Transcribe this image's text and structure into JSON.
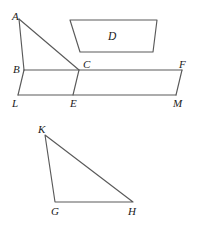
{
  "figure": {
    "background_color": "#ffffff",
    "stroke_color": "#5a5a5a",
    "label_color": "#1a1a1a",
    "width": 199,
    "height": 229,
    "points": {
      "A": {
        "x": 19,
        "y": 19
      },
      "B": {
        "x": 24,
        "y": 70
      },
      "C": {
        "x": 79,
        "y": 70
      },
      "F": {
        "x": 182,
        "y": 70
      },
      "L": {
        "x": 18,
        "y": 95
      },
      "E": {
        "x": 73,
        "y": 95
      },
      "M": {
        "x": 176,
        "y": 95
      },
      "D1": {
        "x": 70,
        "y": 20
      },
      "D2": {
        "x": 157,
        "y": 20
      },
      "D3": {
        "x": 153,
        "y": 52
      },
      "D4": {
        "x": 80,
        "y": 52
      },
      "K": {
        "x": 45,
        "y": 135
      },
      "G": {
        "x": 55,
        "y": 202
      },
      "H": {
        "x": 133,
        "y": 202
      }
    },
    "shapes": [
      {
        "name": "triangle-abc",
        "vertices": [
          "A",
          "B",
          "C"
        ]
      },
      {
        "name": "parallelogram-bcel",
        "vertices": [
          "B",
          "C",
          "E",
          "L"
        ]
      },
      {
        "name": "parallelogram-cfme",
        "vertices": [
          "C",
          "F",
          "M",
          "E"
        ]
      },
      {
        "name": "parallelogram-d",
        "vertices": [
          "D1",
          "D2",
          "D3",
          "D4"
        ]
      },
      {
        "name": "triangle-kgh",
        "vertices": [
          "K",
          "G",
          "H"
        ]
      }
    ],
    "labels": {
      "A": "A",
      "B": "B",
      "C": "C",
      "D": "D",
      "E": "E",
      "F": "F",
      "G": "G",
      "H": "H",
      "K": "K",
      "L": "L",
      "M": "M"
    },
    "label_positions": {
      "A": {
        "x": 12,
        "y": 11
      },
      "B": {
        "x": 13,
        "y": 64
      },
      "C": {
        "x": 83,
        "y": 59
      },
      "D": {
        "x": 108,
        "y": 31
      },
      "E": {
        "x": 70,
        "y": 98
      },
      "F": {
        "x": 179,
        "y": 59
      },
      "G": {
        "x": 51,
        "y": 206
      },
      "H": {
        "x": 128,
        "y": 206
      },
      "K": {
        "x": 38,
        "y": 124
      },
      "L": {
        "x": 12,
        "y": 98
      },
      "M": {
        "x": 173,
        "y": 98
      }
    }
  }
}
